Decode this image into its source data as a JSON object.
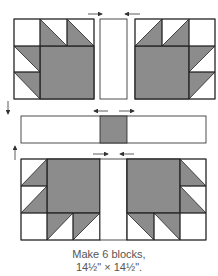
{
  "diagram": {
    "colors": {
      "fabric_dark": "#8c8c8c",
      "fabric_light": "#ffffff",
      "outline": "#222222",
      "arrow": "#333333"
    },
    "rows": [
      {
        "name": "top-row",
        "units": [
          "paw-unit-left",
          "sashing-strip",
          "paw-unit-right"
        ],
        "pressing": [
          "→",
          "←"
        ]
      },
      {
        "name": "middle-row",
        "units": [
          "sashing-strip",
          "center-square",
          "sashing-strip"
        ],
        "pressing": [
          "←",
          "→"
        ]
      },
      {
        "name": "bottom-row",
        "units": [
          "paw-unit-left",
          "sashing-strip",
          "paw-unit-right"
        ],
        "pressing": [
          "→",
          "←"
        ]
      }
    ],
    "row_pressing": [
      "↓",
      "↑"
    ]
  },
  "caption": {
    "line1": "Make 6 blocks,",
    "line2": "14½\" × 14½\"."
  }
}
